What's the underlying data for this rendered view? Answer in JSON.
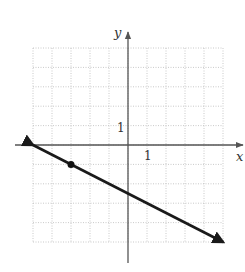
{
  "chart_data": {
    "type": "line",
    "title": "",
    "xlabel": "x",
    "ylabel": "y",
    "xlim": [
      -5,
      5
    ],
    "ylim": [
      -5,
      5
    ],
    "grid": true,
    "grid_style": "dotted",
    "tick_labels": {
      "x": "1",
      "y": "1"
    },
    "series": [
      {
        "name": "line",
        "equation": "y = -x/2 - 5/2",
        "slope": -0.5,
        "intercept": -2.5,
        "x": [
          -5,
          -3,
          0,
          5
        ],
        "y": [
          0,
          -1,
          -2.5,
          -5
        ],
        "arrows": "both ends"
      }
    ],
    "marked_points": [
      {
        "x": -3,
        "y": -1
      }
    ]
  },
  "labels": {
    "x_axis": "x",
    "y_axis": "y",
    "x_tick": "1",
    "y_tick": "1"
  },
  "colors": {
    "axis": "#555555",
    "grid": "#bbbbbb",
    "line": "#1a1a1a"
  }
}
